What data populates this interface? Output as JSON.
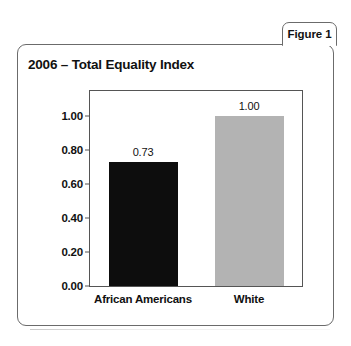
{
  "figure": {
    "tab_label": "Figure 1"
  },
  "chart_data": {
    "type": "bar",
    "title": "2006 – Total Equality Index",
    "xlabel": "",
    "ylabel": "",
    "categories": [
      "African Americans",
      "White"
    ],
    "values": [
      0.73,
      1.0
    ],
    "value_labels": [
      "0.73",
      "1.00"
    ],
    "bar_colors": [
      "#0d0d0d",
      "#b3b3b3"
    ],
    "ylim": [
      0.0,
      1.15
    ],
    "yticks": [
      0.0,
      0.2,
      0.4,
      0.6,
      0.8,
      1.0
    ],
    "ytick_labels": [
      "0.00",
      "0.20",
      "0.40",
      "0.60",
      "0.80",
      "1.00"
    ],
    "grid": false,
    "legend": false
  }
}
